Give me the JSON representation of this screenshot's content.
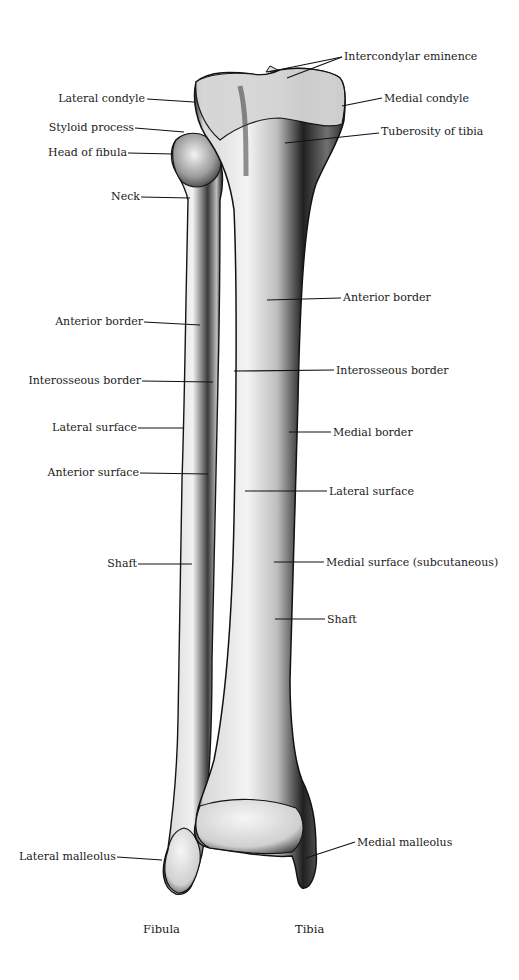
{
  "figure": {
    "background": "#ffffff",
    "bone_color": "#e9e9e9",
    "shadow_color": "#2a2a2a",
    "leader_color": "#111111"
  },
  "labels_left": [
    {
      "text": "Lateral condyle",
      "x": 145,
      "y": 98
    },
    {
      "text": "Styloid process",
      "x": 134,
      "y": 128
    },
    {
      "text": "Head of fibula",
      "x": 127,
      "y": 152
    },
    {
      "text": "Neck",
      "x": 140,
      "y": 196
    },
    {
      "text": "Anterior border",
      "x": 143,
      "y": 321
    },
    {
      "text": "Interosseous border",
      "x": 141,
      "y": 380
    },
    {
      "text": "Lateral surface",
      "x": 137,
      "y": 427
    },
    {
      "text": "Anterior surface",
      "x": 139,
      "y": 471
    },
    {
      "text": "Shaft",
      "x": 137,
      "y": 563
    },
    {
      "text": "Lateral malleolus",
      "x": 116,
      "y": 856
    }
  ],
  "labels_right": [
    {
      "text": "Intercondylar eminence",
      "x": 344,
      "y": 56
    },
    {
      "text": "Medial condyle",
      "x": 384,
      "y": 98
    },
    {
      "text": "Tuberosity of tibia",
      "x": 381,
      "y": 131
    },
    {
      "text": "Anterior border",
      "x": 343,
      "y": 297
    },
    {
      "text": "Interosseous border",
      "x": 336,
      "y": 370
    },
    {
      "text": "Medial border",
      "x": 333,
      "y": 432
    },
    {
      "text": "Lateral surface",
      "x": 329,
      "y": 491
    },
    {
      "text": "Medial surface (subcutaneous)",
      "x": 326,
      "y": 562
    },
    {
      "text": "Shaft",
      "x": 327,
      "y": 619
    },
    {
      "text": "Medial malleolus",
      "x": 357,
      "y": 842
    }
  ],
  "captions": {
    "fibula": "Fibula",
    "tibia": "Tibia"
  }
}
